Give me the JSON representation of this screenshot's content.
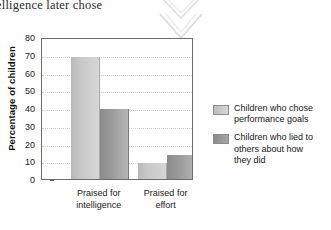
{
  "page": {
    "running_text": "elligence later chose",
    "ornament": "double-chevron-down"
  },
  "chart_data": {
    "type": "bar",
    "title": "",
    "subtitle": "",
    "xlabel": "",
    "ylabel": "Percentage of children",
    "categories": [
      "Praised for intelligence",
      "Praised for effort"
    ],
    "category_lines": [
      [
        "Praised for",
        "intelligence"
      ],
      [
        "Praised for",
        "effort"
      ]
    ],
    "series": [
      {
        "name": "Children who chose performance goals",
        "name_lines": [
          "Children who chose",
          "performance goals"
        ],
        "color": "#c8c8c8",
        "values": [
          68.5,
          9
        ]
      },
      {
        "name": "Children who lied to others about how they did",
        "name_lines": [
          "Children who lied to",
          "others about how",
          "they did"
        ],
        "color": "#949494",
        "values": [
          39.5,
          13.5
        ]
      }
    ],
    "ylim": [
      0,
      80
    ],
    "yticks": [
      0,
      10,
      20,
      30,
      40,
      50,
      60,
      70,
      80
    ],
    "ytick_labels": [
      "0",
      "10",
      "20",
      "30",
      "40",
      "50",
      "60",
      "70",
      "80"
    ],
    "grid": true,
    "grid_axis": "y",
    "grid_style": "dotted",
    "legend_position": "right"
  }
}
